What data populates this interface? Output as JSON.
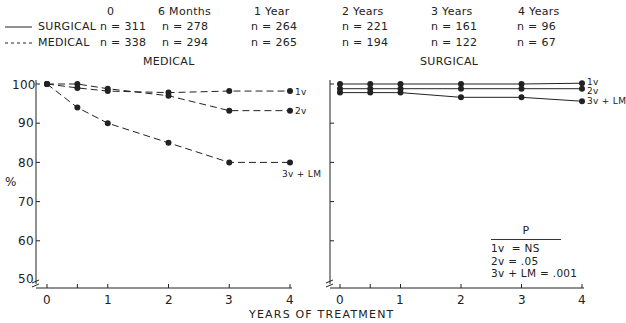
{
  "legend": {
    "surgical_label": "SURGICAL",
    "medical_label": "MEDICAL"
  },
  "timepoints": [
    {
      "label": "0",
      "surgical_n": "n = 311",
      "medical_n": "n = 338"
    },
    {
      "label": "6 Months",
      "surgical_n": "n = 278",
      "medical_n": "n = 294"
    },
    {
      "label": "1 Year",
      "surgical_n": "n = 264",
      "medical_n": "n = 265"
    },
    {
      "label": "2 Years",
      "surgical_n": "n = 221",
      "medical_n": "n = 194"
    },
    {
      "label": "3 Years",
      "surgical_n": "n = 161",
      "medical_n": "n = 122"
    },
    {
      "label": "4 Years",
      "surgical_n": "n = 96",
      "medical_n": "n = 67"
    }
  ],
  "panels": {
    "medical_title": "MEDICAL",
    "surgical_title": "SURGICAL"
  },
  "y_axis": {
    "label": "%",
    "ticks": [
      "100",
      "90",
      "80",
      "70",
      "60",
      "50"
    ]
  },
  "x_axis": {
    "label": "YEARS OF TREATMENT",
    "ticks": [
      "0",
      "1",
      "2",
      "3",
      "4"
    ]
  },
  "p_values": {
    "title": "P",
    "rows": [
      "1v  = NS",
      "2v = .05",
      "3v + LM = .001"
    ]
  },
  "series_labels": {
    "v1": "1v",
    "v2": "2v",
    "v3": "3v + LM"
  },
  "chart_data": [
    {
      "type": "line",
      "title": "MEDICAL",
      "xlabel": "YEARS OF TREATMENT",
      "ylabel": "%",
      "ylim": [
        50,
        100
      ],
      "xlim": [
        0,
        4
      ],
      "line_style": "dashed",
      "x": [
        0,
        0.5,
        1,
        2,
        3,
        4
      ],
      "series": [
        {
          "name": "1v",
          "values": [
            100,
            99,
            98.2,
            97.8,
            98.2,
            98.2
          ]
        },
        {
          "name": "2v",
          "values": [
            100,
            100,
            98.8,
            97,
            93.2,
            93.2
          ]
        },
        {
          "name": "3v + LM",
          "values": [
            100,
            94,
            90,
            85,
            80,
            80
          ]
        }
      ]
    },
    {
      "type": "line",
      "title": "SURGICAL",
      "xlabel": "YEARS OF TREATMENT",
      "ylabel": "%",
      "ylim": [
        50,
        100
      ],
      "xlim": [
        0,
        4
      ],
      "line_style": "solid",
      "x": [
        0,
        0.5,
        1,
        2,
        3,
        4
      ],
      "series": [
        {
          "name": "1v",
          "values": [
            100,
            100,
            100,
            100,
            100,
            100.2
          ]
        },
        {
          "name": "2v",
          "values": [
            98.8,
            98.8,
            98.8,
            98.8,
            98.8,
            98.8
          ]
        },
        {
          "name": "3v + LM",
          "values": [
            97.8,
            97.8,
            97.8,
            96.6,
            96.6,
            95.6
          ]
        }
      ],
      "annotation": {
        "P": {
          "1v": "NS",
          "2v": ".05",
          "3v + LM": ".001"
        }
      }
    }
  ]
}
